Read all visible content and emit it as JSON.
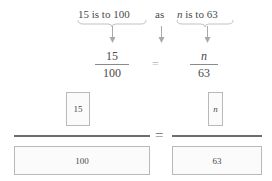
{
  "diagram": {
    "statement": {
      "left_phrase": "15 is to 100",
      "connector": "as",
      "right_phrase_variable": "n",
      "right_phrase_rest": " is to 63",
      "right_phrase_full": "n is to 63"
    },
    "arrows": [
      {
        "name": "arrow-left",
        "glyph": "↓"
      },
      {
        "name": "arrow-middle",
        "glyph": "↓"
      },
      {
        "name": "arrow-right",
        "glyph": "↓"
      }
    ],
    "equation": {
      "left_numerator": "15",
      "left_denominator": "100",
      "equals": "=",
      "right_numerator": "n",
      "right_denominator": "63"
    },
    "bar_model": {
      "equals": "=",
      "left_numerator_label": "15",
      "left_denominator_label": "100",
      "right_numerator_label": "n",
      "right_denominator_label": "63"
    },
    "colors": {
      "text": "#4a4a4a",
      "box_border": "#b9b9b9",
      "box_fill": "#fbfbfb",
      "rule": "#6d6d6d",
      "background": "#ffffff"
    }
  }
}
